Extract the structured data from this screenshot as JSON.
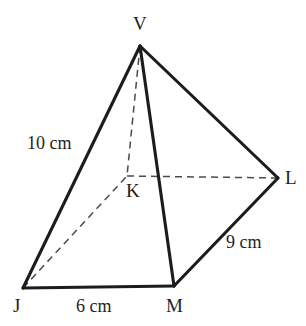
{
  "figure": {
    "name": "square-based-pyramid-VJKLM",
    "background_color": "#ffffff",
    "line_color": "#1c1c1c",
    "hidden_line_color": "#4a4a4a",
    "vertices": {
      "V": {
        "label": "V",
        "x": 140,
        "y": 46
      },
      "J": {
        "label": "J",
        "x": 23,
        "y": 288
      },
      "M": {
        "label": "M",
        "x": 174,
        "y": 286
      },
      "L": {
        "label": "L",
        "x": 278,
        "y": 178
      },
      "K": {
        "label": "K",
        "x": 127,
        "y": 176
      }
    },
    "edges": [
      {
        "name": "edge-V-J",
        "from": "V",
        "to": "J",
        "style": "solid"
      },
      {
        "name": "edge-V-M",
        "from": "V",
        "to": "M",
        "style": "solid"
      },
      {
        "name": "edge-V-L",
        "from": "V",
        "to": "L",
        "style": "solid"
      },
      {
        "name": "edge-J-M",
        "from": "J",
        "to": "M",
        "style": "solid"
      },
      {
        "name": "edge-M-L",
        "from": "M",
        "to": "L",
        "style": "solid"
      },
      {
        "name": "edge-V-K",
        "from": "V",
        "to": "K",
        "style": "dashed"
      },
      {
        "name": "edge-J-K",
        "from": "J",
        "to": "K",
        "style": "dashed"
      },
      {
        "name": "edge-K-L",
        "from": "K",
        "to": "L",
        "style": "dashed"
      }
    ],
    "measurements": {
      "slant_edge_JV": "10 cm",
      "base_edge_ML": "9 cm",
      "base_edge_JM": "6 cm"
    }
  }
}
